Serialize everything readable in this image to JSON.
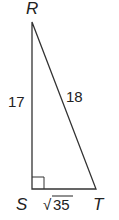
{
  "diagram": {
    "type": "right-triangle",
    "vertices": {
      "R": {
        "label": "R",
        "x": 32,
        "y": 22
      },
      "S": {
        "label": "S",
        "x": 32,
        "y": 189
      },
      "T": {
        "label": "T",
        "x": 96,
        "y": 189
      }
    },
    "right_angle_at": "S",
    "sides": {
      "RS": {
        "label": "17"
      },
      "RT": {
        "label": "18"
      },
      "ST": {
        "label_radical": "√",
        "label_value": "35"
      }
    },
    "colors": {
      "stroke": "#333333",
      "text": "#222222"
    }
  }
}
